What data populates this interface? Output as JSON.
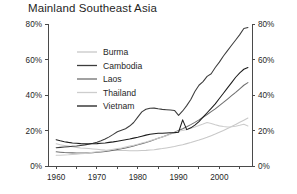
{
  "chart_data": {
    "type": "line",
    "title": "Mainland Southeast Asia",
    "xlabel": "",
    "ylabel": "",
    "xlim": [
      1958,
      2008
    ],
    "ylim": [
      0,
      80
    ],
    "grid": false,
    "legend_position": "upper-left-inside",
    "y_axis_duplicated_right": true,
    "y_ticks": [
      0,
      20,
      40,
      60,
      80
    ],
    "y_tick_labels": [
      "0%",
      "20%",
      "40%",
      "60%",
      "80%"
    ],
    "x_ticks": [
      1960,
      1965,
      1970,
      1975,
      1980,
      1985,
      1990,
      1995,
      2000,
      2005
    ],
    "x_tick_labels_shown": [
      "1960",
      "1970",
      "1980",
      "1990",
      "2000"
    ],
    "x_labeled_ticks": [
      1960,
      1970,
      1980,
      1990,
      2000
    ],
    "x": [
      1960,
      1961,
      1962,
      1963,
      1964,
      1965,
      1966,
      1967,
      1968,
      1969,
      1970,
      1971,
      1972,
      1973,
      1974,
      1975,
      1976,
      1977,
      1978,
      1979,
      1980,
      1981,
      1982,
      1983,
      1984,
      1985,
      1986,
      1987,
      1988,
      1989,
      1990,
      1991,
      1992,
      1993,
      1994,
      1995,
      1996,
      1997,
      1998,
      1999,
      2000,
      2001,
      2002,
      2003,
      2004,
      2005,
      2006,
      2007
    ],
    "series": [
      {
        "name": "Burma",
        "color": "#c8c8c8",
        "values": [
          12.5,
          12.0,
          11.6,
          11.2,
          10.8,
          10.5,
          10.2,
          10.0,
          9.8,
          9.6,
          9.4,
          9.2,
          9.0,
          8.9,
          8.8,
          8.8,
          8.7,
          8.7,
          8.6,
          8.6,
          8.6,
          8.7,
          8.8,
          9.0,
          9.2,
          9.5,
          9.8,
          10.2,
          10.6,
          11.0,
          11.5,
          12.0,
          12.6,
          13.2,
          13.9,
          14.6,
          15.4,
          16.2,
          17.1,
          18.0,
          19.0,
          20.0,
          21.1,
          22.2,
          23.4,
          24.6,
          25.8,
          27.0
        ]
      },
      {
        "name": "Cambodia",
        "color": "#3c3c3c",
        "values": [
          10.3,
          10.5,
          10.7,
          10.9,
          11.1,
          11.3,
          11.6,
          11.9,
          12.3,
          12.8,
          13.4,
          14.2,
          15.2,
          16.4,
          17.8,
          19.3,
          20.2,
          21.0,
          22.5,
          24.5,
          27.5,
          30.5,
          32.0,
          32.5,
          32.6,
          32.2,
          31.9,
          31.7,
          31.5,
          31.3,
          28.5,
          31.0,
          34.0,
          37.5,
          42.0,
          45.5,
          47.5,
          50.5,
          52.0,
          55.5,
          58.5,
          62.0,
          65.0,
          68.0,
          71.0,
          74.0,
          77.5,
          78.0
        ]
      },
      {
        "name": "Laos",
        "color": "#6e6e6e",
        "values": [
          8.0,
          7.8,
          7.6,
          7.5,
          7.4,
          7.3,
          7.3,
          7.3,
          7.4,
          7.5,
          7.7,
          7.9,
          8.2,
          8.5,
          8.9,
          9.3,
          9.7,
          10.2,
          10.7,
          11.3,
          12.0,
          12.6,
          13.3,
          14.0,
          14.8,
          15.6,
          16.4,
          17.2,
          18.1,
          19.0,
          20.0,
          21.0,
          22.1,
          23.3,
          24.6,
          26.0,
          27.5,
          29.0,
          30.6,
          32.2,
          34.0,
          35.8,
          37.7,
          39.6,
          41.5,
          43.5,
          45.5,
          47.0
        ]
      },
      {
        "name": "Thailand",
        "color": "#cdcdcd",
        "values": [
          6.0,
          6.1,
          6.2,
          6.3,
          6.5,
          6.7,
          6.9,
          7.1,
          7.4,
          7.7,
          8.0,
          8.3,
          8.6,
          9.0,
          9.4,
          9.8,
          10.2,
          10.7,
          11.2,
          11.7,
          12.3,
          12.9,
          13.5,
          14.2,
          14.9,
          15.6,
          16.3,
          17.1,
          17.9,
          18.8,
          19.7,
          20.0,
          20.6,
          21.3,
          22.0,
          22.8,
          23.6,
          24.5,
          24.0,
          23.2,
          22.6,
          22.2,
          22.0,
          22.1,
          22.4,
          22.9,
          23.5,
          22.5
        ]
      },
      {
        "name": "Vietnam",
        "color": "#1c1c1c",
        "values": [
          14.8,
          14.2,
          13.7,
          13.3,
          13.0,
          12.8,
          12.6,
          12.5,
          12.5,
          12.5,
          12.6,
          12.8,
          13.0,
          13.3,
          13.6,
          14.0,
          14.4,
          14.8,
          15.2,
          15.7,
          16.2,
          16.8,
          17.4,
          17.9,
          18.2,
          18.4,
          18.5,
          18.6,
          18.7,
          18.8,
          19.0,
          26.0,
          20.5,
          21.5,
          23.0,
          25.0,
          27.5,
          30.0,
          32.5,
          35.0,
          38.0,
          41.0,
          44.0,
          47.0,
          50.0,
          52.5,
          54.5,
          55.5
        ]
      }
    ]
  },
  "legend": {
    "entries": [
      {
        "label": "Burma"
      },
      {
        "label": "Cambodia"
      },
      {
        "label": "Laos"
      },
      {
        "label": "Thailand"
      },
      {
        "label": "Vietnam"
      }
    ]
  },
  "axes": {
    "left_labels": [
      "80%",
      "60%",
      "40%",
      "20%",
      "0%"
    ],
    "right_labels": [
      "80%",
      "60%",
      "40%",
      "20%",
      "0%"
    ],
    "bottom_labels": [
      "1960",
      "1970",
      "1980",
      "1990",
      "2000"
    ]
  }
}
